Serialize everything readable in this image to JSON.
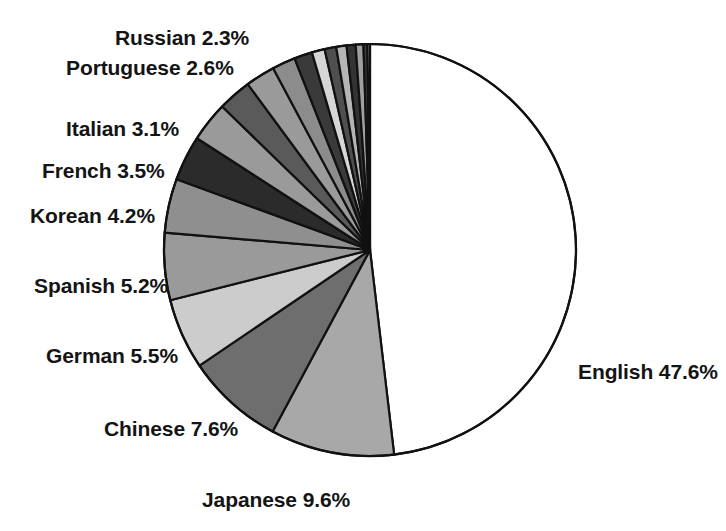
{
  "chart_data": {
    "type": "pie",
    "title": "",
    "subtitle": "",
    "xlabel": "",
    "ylabel": "",
    "legend_position": "none",
    "grid": false,
    "units": "percent",
    "start_angle_deg": 90,
    "direction": "clockwise",
    "categories": [
      "English",
      "Japanese",
      "Chinese",
      "German",
      "Spanish",
      "Korean",
      "French",
      "Italian",
      "Portuguese",
      "Russian"
    ],
    "values": [
      47.6,
      9.6,
      7.6,
      5.5,
      5.2,
      4.2,
      3.5,
      3.1,
      2.6,
      2.3
    ],
    "slices": [
      {
        "name": "English",
        "value": 47.6,
        "label": "English 47.6%",
        "color": "#ffffff",
        "label_x": 578,
        "label_y": 361,
        "anchor": "left-anchor"
      },
      {
        "name": "Japanese",
        "value": 9.6,
        "label": "Japanese 9.6%",
        "color": "#a8a8a8",
        "label_x": 202,
        "label_y": 489,
        "anchor": "left-anchor"
      },
      {
        "name": "Chinese",
        "value": 7.6,
        "label": "Chinese 7.6%",
        "color": "#6e6e6e",
        "label_x": 104,
        "label_y": 418,
        "anchor": "left-anchor"
      },
      {
        "name": "German",
        "value": 5.5,
        "label": "German 5.5%",
        "color": "#cccccc",
        "label_x": 46,
        "label_y": 345,
        "anchor": "left-anchor"
      },
      {
        "name": "Spanish",
        "value": 5.2,
        "label": "Spanish 5.2%",
        "color": "#9a9a9a",
        "label_x": 34,
        "label_y": 275,
        "anchor": "left-anchor"
      },
      {
        "name": "Korean",
        "value": 4.2,
        "label": "Korean 4.2%",
        "color": "#8f8f8f",
        "label_x": 30,
        "label_y": 205,
        "anchor": "left-anchor"
      },
      {
        "name": "French",
        "value": 3.5,
        "label": "French 3.5%",
        "color": "#2b2b2b",
        "label_x": 42,
        "label_y": 160,
        "anchor": "left-anchor"
      },
      {
        "name": "Italian",
        "value": 3.1,
        "label": "Italian 3.1%",
        "color": "#9a9a9a",
        "label_x": 66,
        "label_y": 118,
        "anchor": "left-anchor"
      },
      {
        "name": "Portuguese",
        "value": 2.6,
        "label": "Portuguese 2.6%",
        "color": "#5a5a5a",
        "label_x": 66,
        "label_y": 57,
        "anchor": "left-anchor"
      },
      {
        "name": "Russian",
        "value": 2.3,
        "label": "Russian 2.3%",
        "color": "#9a9a9a",
        "label_x": 115,
        "label_y": 27,
        "anchor": "left-anchor"
      }
    ],
    "unlabeled_slices": [
      {
        "name": "other-1",
        "value": 1.8,
        "color": "#8c8c8c"
      },
      {
        "name": "other-2",
        "value": 1.4,
        "color": "#3a3a3a"
      },
      {
        "name": "other-3",
        "value": 1.0,
        "color": "#d6d6d6"
      },
      {
        "name": "other-4",
        "value": 0.9,
        "color": "#4f4f4f"
      },
      {
        "name": "other-5",
        "value": 0.8,
        "color": "#b5b5b5"
      },
      {
        "name": "other-6",
        "value": 0.7,
        "color": "#333333"
      },
      {
        "name": "other-7",
        "value": 0.6,
        "color": "#9f9f9f"
      },
      {
        "name": "other-8",
        "value": 0.3,
        "color": "#3f3f3f"
      },
      {
        "name": "other-9",
        "value": 0.2,
        "color": "#a8a8a8"
      }
    ]
  },
  "geometry": {
    "center_x": 370,
    "center_y": 250,
    "radius": 206,
    "stroke_color": "#111111",
    "stroke_width": 2.2
  }
}
